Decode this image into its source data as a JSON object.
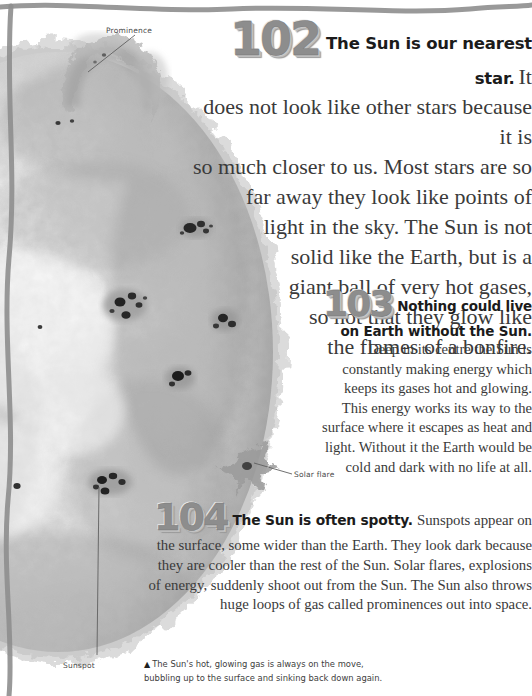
{
  "page": {
    "background_color": "#ffffff",
    "border_color": "#8e8e8e",
    "text_color": "#3a3a3a"
  },
  "artwork": {
    "name": "sun-photograph",
    "description": "Greyscale close-up photograph of the Sun showing mottled granulated surface, dark sunspot clusters, a looping prominence at the top edge and a solar flare at the right limb.",
    "labels": [
      {
        "id": "prominence",
        "text": "Prominence"
      },
      {
        "id": "solar-flare",
        "text": "Solar flare"
      },
      {
        "id": "sunspot",
        "text": "Sunspot"
      }
    ]
  },
  "facts": [
    {
      "number": "102",
      "lead": "The Sun is our nearest star.",
      "body_lines": [
        "It",
        "does not look like other stars because it is",
        "so much closer to us. Most stars are so",
        "far away they look like points of",
        "light in the sky. The Sun is not",
        "solid like the Earth, but is a",
        "giant ball of very hot gases,",
        "so hot that they glow like",
        "the flames of a bonfire."
      ],
      "body": "It does not look like other stars because it is so much closer to us. Most stars are so far away they look like points of light in the sky. The Sun is not solid like the Earth, but is a giant ball of very hot gases, so hot that they glow like the flames of a bonfire."
    },
    {
      "number": "103",
      "lead": "Nothing could live on Earth without the Sun.",
      "body_lines": [
        "Deep in its",
        "centre the Sun is constantly making",
        "energy which keeps its gases hot",
        "and glowing. This energy works its",
        "way to the surface where it escapes",
        "as heat and light. Without it the",
        "Earth would be cold and dark with",
        "no life at all."
      ],
      "body": "Deep in its centre the Sun is constantly making energy which keeps its gases hot and glowing. This energy works its way to the surface where it escapes as heat and light. Without it the Earth would be cold and dark with no life at all."
    },
    {
      "number": "104",
      "lead": "The Sun is often spotty.",
      "body_lines": [
        "Sunspots appear on the surface,",
        "some wider than the Earth. They look dark",
        "because they are cooler than the rest of the",
        "Sun. Solar flares, explosions of energy, suddenly",
        "shoot out from the Sun. The Sun also throws huge",
        "loops of gas called prominences out into space."
      ],
      "body": "Sunspots appear on the surface, some wider than the Earth. They look dark because they are cooler than the rest of the Sun. Solar flares, explosions of energy, suddenly shoot out from the Sun. The Sun also throws huge loops of gas called prominences out into space."
    }
  ],
  "caption": {
    "marker": "▲",
    "line1": "The Sun's hot, glowing gas is always on the move,",
    "line2": "bubbling up to the surface and sinking back down again."
  }
}
